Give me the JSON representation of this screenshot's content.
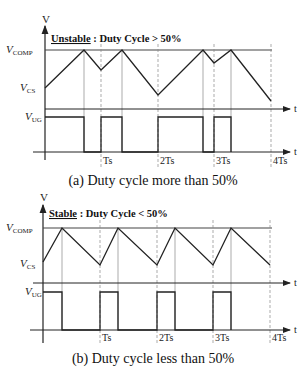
{
  "panels": [
    {
      "id": "a",
      "title_underlined": "Unstable",
      "title_rest": " : Duty Cycle > 50%",
      "caption": "(a) Duty cycle more than 50%",
      "y_axis_label": "V",
      "signals": {
        "vcomp": {
          "main": "V",
          "sub": "COMP"
        },
        "vcs": {
          "main": "V",
          "sub": "CS"
        },
        "vug": {
          "main": "V",
          "sub": "UG"
        }
      },
      "t_label": "t",
      "period_ticks": [
        "Ts",
        "2Ts",
        "3Ts",
        "4Ts"
      ]
    },
    {
      "id": "b",
      "title_underlined": "Stable",
      "title_rest": " : Duty Cycle < 50%",
      "caption": "(b) Duty cycle less than 50%",
      "y_axis_label": "V",
      "signals": {
        "vcomp": {
          "main": "V",
          "sub": "COMP"
        },
        "vcs": {
          "main": "V",
          "sub": "CS"
        },
        "vug": {
          "main": "V",
          "sub": "UG"
        }
      },
      "t_label": "t",
      "period_ticks": [
        "Ts",
        "2Ts",
        "3Ts",
        "4Ts"
      ]
    }
  ],
  "colors": {
    "line": "#222222",
    "grid": "#888888"
  }
}
